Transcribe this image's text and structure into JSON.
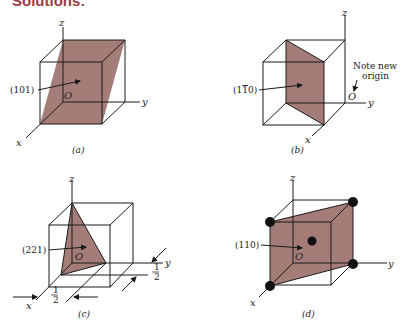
{
  "header": {
    "title": "Solutions:"
  },
  "colors": {
    "plane_fill": "#a57d78",
    "header": "#9a3b43",
    "line": "#1a1a1a"
  },
  "panels": [
    {
      "id": "a",
      "caption": "(a)",
      "plane_label": "(101)",
      "axes": {
        "x": "x",
        "y": "y",
        "z": "z",
        "origin": "O"
      }
    },
    {
      "id": "b",
      "caption": "(b)",
      "plane_label": "(1̅0)",
      "plane_label_plain": "(1",
      "plane_label_bar": "1",
      "plane_label_end": "0)",
      "axes": {
        "x": "x",
        "y": "y",
        "z": "z",
        "origin": "O"
      },
      "note": [
        "Note new",
        "origin"
      ]
    },
    {
      "id": "c",
      "caption": "(c)",
      "plane_label": "(221)",
      "axes": {
        "x": "x",
        "y": "y",
        "z": "z",
        "origin": "O"
      },
      "fractions": {
        "x_intercept": [
          "1",
          "2"
        ],
        "y_intercept": [
          "1",
          "2"
        ]
      }
    },
    {
      "id": "d",
      "caption": "(d)",
      "plane_label": "(110)",
      "axes": {
        "x": "x",
        "y": "y",
        "z": "z",
        "origin": "O"
      }
    }
  ]
}
